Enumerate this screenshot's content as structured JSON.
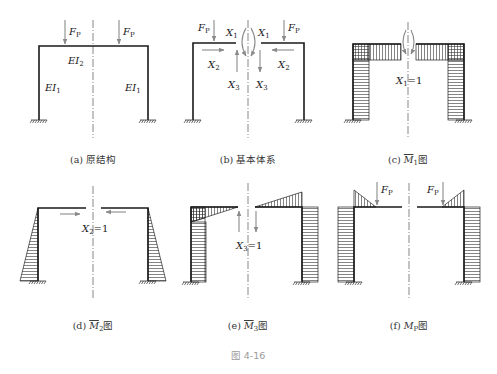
{
  "figure": {
    "title": "图 4-16",
    "panels": [
      {
        "id": "a",
        "caption": "(a) 原结构",
        "labels": {
          "load_left": "F",
          "load_right": "F",
          "load_sub": "P",
          "beam": "EI",
          "beam_sub": "2",
          "col_left": "EI",
          "col_left_sub": "1",
          "col_right": "EI",
          "col_right_sub": "1"
        }
      },
      {
        "id": "b",
        "caption": "(b) 基本体系",
        "labels": {
          "load": "F",
          "load_sub": "P",
          "x1": "X",
          "x1_sub": "1",
          "x2": "X",
          "x2_sub": "2",
          "x3": "X",
          "x3_sub": "3"
        }
      },
      {
        "id": "c",
        "caption_prefix": "(c) ",
        "caption_sym": "M",
        "caption_sub": "1",
        "caption_suffix": "图",
        "labels": {
          "unit": "X",
          "unit_sub": "1",
          "unit_val": "=1"
        }
      },
      {
        "id": "d",
        "caption_prefix": "(d) ",
        "caption_sym": "M",
        "caption_sub": "2",
        "caption_suffix": "图",
        "labels": {
          "unit": "X",
          "unit_sub": "2",
          "unit_val": "=1"
        }
      },
      {
        "id": "e",
        "caption_prefix": "(e) ",
        "caption_sym": "M",
        "caption_sub": "3",
        "caption_suffix": "图",
        "labels": {
          "unit": "X",
          "unit_sub": "3",
          "unit_val": "=1"
        }
      },
      {
        "id": "f",
        "caption_prefix": "(f) ",
        "caption_sym": "M",
        "caption_sub": "P",
        "caption_suffix": "图",
        "labels": {
          "load": "F",
          "load_sub": "P"
        }
      }
    ]
  },
  "colors": {
    "line": "#1a1a1a",
    "force": "#8a8a8a",
    "caption": "#333333",
    "figure_number": "#9a9a9a"
  }
}
